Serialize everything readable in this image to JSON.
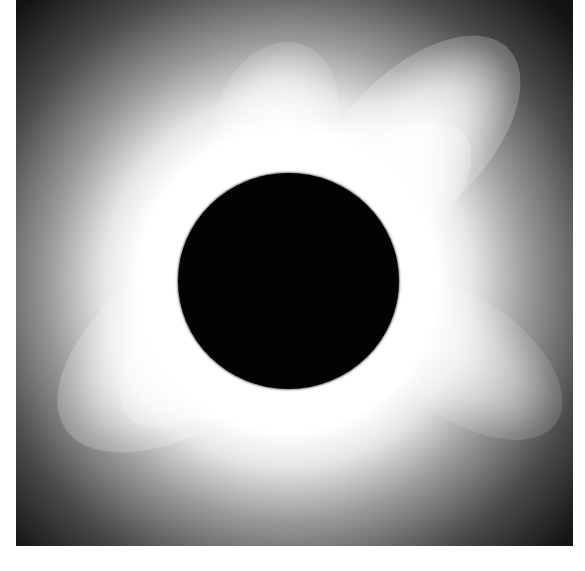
{
  "image": {
    "subject": "Total solar eclipse with white corona around dark lunar disk",
    "colors": {
      "background": "#ffffff",
      "sky": "#030303",
      "corona": "#ffffff",
      "disk": "#030303"
    }
  }
}
